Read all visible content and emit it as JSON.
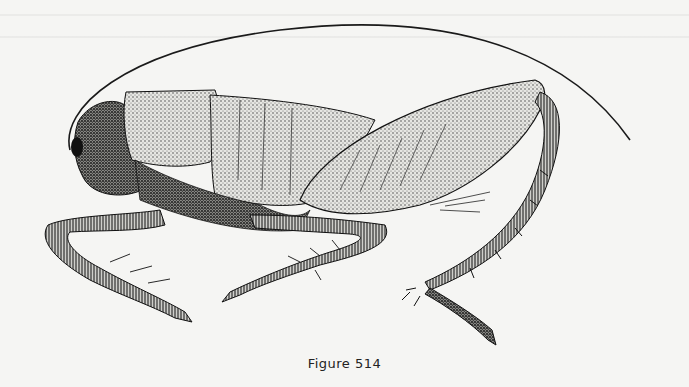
{
  "figure": {
    "caption": "Figure 514",
    "style": "stippled pen-and-ink",
    "colors": {
      "background": "#f5f5f3",
      "ink": "#1a1a1a",
      "stipple_light": "#d8d8d4",
      "stipple_mid": "#9a9a96"
    }
  }
}
